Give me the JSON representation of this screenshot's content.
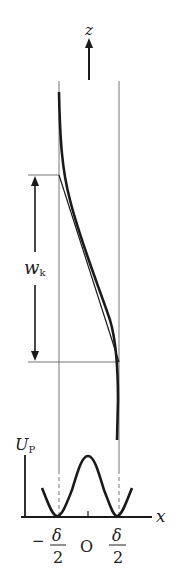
{
  "diagram": {
    "axis_z_label": "z",
    "width_label_main": "w",
    "width_label_sub": "k",
    "potential_label_main": "U",
    "potential_label_sub": "P",
    "axis_x_label": "x",
    "origin_label": "O",
    "tick_left": {
      "sign": "−",
      "numerator": "δ",
      "denominator": "2"
    },
    "tick_right": {
      "numerator": "δ",
      "denominator": "2"
    },
    "colors": {
      "curve": "#1a1a1a",
      "guide": "#777777",
      "text": "#222222"
    }
  }
}
